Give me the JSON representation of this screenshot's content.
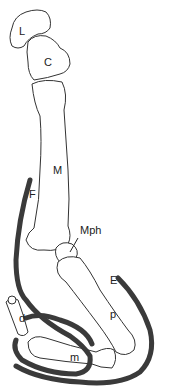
{
  "figure": {
    "type": "anatomical-illustration",
    "labels": {
      "L": "L",
      "C": "C",
      "M": "M",
      "F": "F",
      "Mph": "Mph",
      "E": "E",
      "p": "p",
      "d": "d",
      "m": "m"
    },
    "colors": {
      "line": "#333333",
      "pad": "#3a3a3a",
      "background": "#ffffff"
    }
  }
}
